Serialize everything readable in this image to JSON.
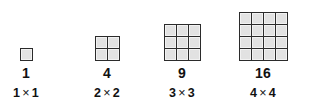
{
  "figure": {
    "background_color": "#ffffff",
    "cell_fill_color": "#e2e2e2",
    "grid_line_color": "#2b2b2b",
    "text_color": "#111111",
    "multiplication_sign": "×"
  },
  "columns": [
    {
      "rows": 1,
      "cols": 1,
      "cell_count": 1,
      "count_label": "1",
      "dims_left": "1",
      "dims_right": "1",
      "dims_label": "1 × 1"
    },
    {
      "rows": 2,
      "cols": 2,
      "cell_count": 4,
      "count_label": "4",
      "dims_left": "2",
      "dims_right": "2",
      "dims_label": "2 × 2"
    },
    {
      "rows": 3,
      "cols": 3,
      "cell_count": 9,
      "count_label": "9",
      "dims_left": "3",
      "dims_right": "3",
      "dims_label": "3 × 3"
    },
    {
      "rows": 4,
      "cols": 4,
      "cell_count": 16,
      "count_label": "16",
      "dims_left": "4",
      "dims_right": "4",
      "dims_label": "4 × 4"
    }
  ]
}
